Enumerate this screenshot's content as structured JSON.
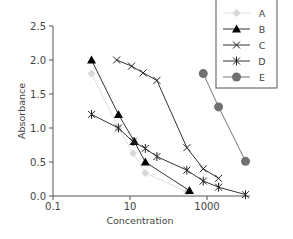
{
  "chart_data": {
    "type": "line",
    "title": "",
    "xlabel": "Concentration",
    "ylabel": "Absorbance",
    "xscale": "log",
    "xlim": [
      0.1,
      10000
    ],
    "ylim": [
      0,
      2.5
    ],
    "x_ticks": [
      0.1,
      10,
      1000
    ],
    "x_tick_labels": [
      "0.1",
      "10",
      "1000"
    ],
    "y_ticks": [
      0,
      0.5,
      1.0,
      1.5,
      2.0,
      2.5
    ],
    "y_tick_labels": [
      "0.0",
      "0.5",
      "1.0",
      "1.5",
      "2.0",
      "2.5"
    ],
    "grid": false,
    "legend_position": "top-right",
    "series": [
      {
        "name": "A",
        "marker": "diamond",
        "color": "#d8d8d8",
        "x": [
          1,
          5,
          12,
          25,
          300
        ],
        "y": [
          1.8,
          1.0,
          0.63,
          0.34,
          0.06
        ]
      },
      {
        "name": "B",
        "marker": "triangle",
        "color": "#000000",
        "x": [
          1,
          5,
          13,
          25,
          350
        ],
        "y": [
          2.0,
          1.2,
          0.8,
          0.5,
          0.08
        ]
      },
      {
        "name": "C",
        "marker": "x",
        "color": "#222222",
        "x": [
          4.5,
          11,
          22,
          50,
          300,
          800,
          2000
        ],
        "y": [
          2.0,
          1.91,
          1.81,
          1.7,
          0.71,
          0.4,
          0.26
        ]
      },
      {
        "name": "D",
        "marker": "star",
        "color": "#222222",
        "x": [
          1,
          5,
          12,
          25,
          50,
          300,
          800,
          2000,
          10000
        ],
        "y": [
          1.2,
          1.0,
          0.8,
          0.7,
          0.58,
          0.38,
          0.22,
          0.13,
          0.02
        ]
      },
      {
        "name": "E",
        "marker": "circle",
        "color": "#707070",
        "x": [
          800,
          2000,
          10000
        ],
        "y": [
          1.8,
          1.31,
          0.51
        ]
      }
    ]
  }
}
